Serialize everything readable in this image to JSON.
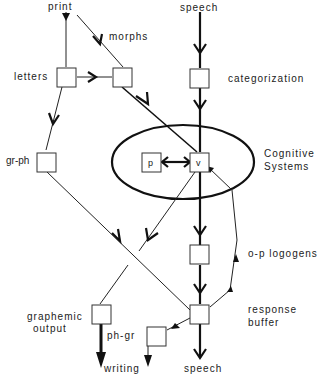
{
  "diagram": {
    "type": "cognitive-model flow diagram (logogen model)",
    "inputs": {
      "print": "print",
      "speech_in": "speech"
    },
    "labels": {
      "morphs": "morphs",
      "letters": "letters",
      "categorization": "categorization",
      "gr_ph": "gr-ph",
      "cognitive_line1": "Cognitive",
      "cognitive_line2": "Systems",
      "p_node": "p",
      "v_node": "v",
      "op_logogens": "o-p logogens",
      "graphemic_line1": "graphemic",
      "graphemic_line2": "output",
      "ph_gr": "ph-gr",
      "response_line1": "response",
      "response_line2": "buffer"
    },
    "outputs": {
      "writing": "writing",
      "speech_out": "speech"
    },
    "nodes": [
      "letters",
      "morphs-box",
      "categorization",
      "gr-ph",
      "p",
      "v",
      "o-p logogens",
      "graphemic output",
      "response buffer",
      "ph-gr"
    ],
    "edges": [
      [
        "print",
        "letters"
      ],
      [
        "print",
        "morphs-box"
      ],
      [
        "letters",
        "morphs-box"
      ],
      [
        "letters",
        "gr-ph"
      ],
      [
        "morphs-box",
        "v"
      ],
      [
        "speech",
        "categorization"
      ],
      [
        "categorization",
        "v"
      ],
      [
        "p",
        "v"
      ],
      [
        "v",
        "p"
      ],
      [
        "v",
        "graphemic output"
      ],
      [
        "v",
        "o-p logogens"
      ],
      [
        "gr-ph",
        "response buffer"
      ],
      [
        "o-p logogens",
        "response buffer"
      ],
      [
        "response buffer",
        "v"
      ],
      [
        "response buffer",
        "ph-gr"
      ],
      [
        "response buffer",
        "speech"
      ],
      [
        "graphemic output",
        "writing"
      ],
      [
        "ph-gr",
        "writing"
      ]
    ]
  }
}
